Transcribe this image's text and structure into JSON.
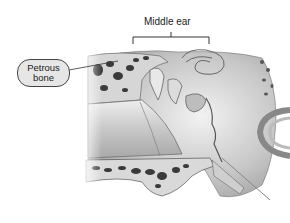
{
  "labels": {
    "middle_ear": "Middle ear",
    "petrous_line1": "Petrous",
    "petrous_line2": "bone"
  },
  "colors": {
    "bone_fill": "#d9d9d9",
    "cavity_dark": "#3a3a3a",
    "tissue_mid": "#b5b5b5",
    "outline": "#555555",
    "label_bg": "#e6e6e6"
  }
}
